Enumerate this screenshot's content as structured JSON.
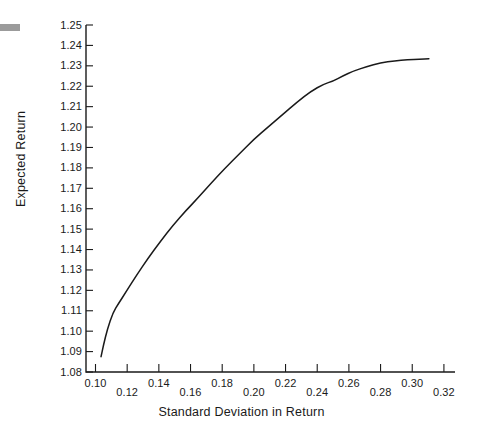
{
  "chart_data": {
    "type": "line",
    "title": "",
    "xlabel": "Standard Deviation in Return",
    "ylabel": "Expected Return",
    "xlim": [
      0.094,
      0.327
    ],
    "ylim": [
      1.08,
      1.25
    ],
    "grid": false,
    "legend": null,
    "xticks": [
      "0.10",
      "0.12",
      "0.14",
      "0.16",
      "0.18",
      "0.20",
      "0.22",
      "0.24",
      "0.26",
      "0.28",
      "0.30",
      "0.32"
    ],
    "xtick_values": [
      0.1,
      0.12,
      0.14,
      0.16,
      0.18,
      0.2,
      0.22,
      0.24,
      0.26,
      0.28,
      0.3,
      0.32
    ],
    "yticks": [
      "1.08",
      "1.09",
      "1.10",
      "1.11",
      "1.12",
      "1.13",
      "1.14",
      "1.15",
      "1.16",
      "1.17",
      "1.18",
      "1.19",
      "1.20",
      "1.21",
      "1.22",
      "1.23",
      "1.24",
      "1.25"
    ],
    "ytick_values": [
      1.08,
      1.09,
      1.1,
      1.11,
      1.12,
      1.13,
      1.14,
      1.15,
      1.16,
      1.17,
      1.18,
      1.19,
      1.2,
      1.21,
      1.22,
      1.23,
      1.24,
      1.25
    ],
    "series": [
      {
        "name": "Efficient Frontier",
        "color": "#1a1a1a",
        "x": [
          0.1035,
          0.105,
          0.1075,
          0.111,
          0.1145,
          0.1195,
          0.126,
          0.133,
          0.141,
          0.149,
          0.157,
          0.165,
          0.173,
          0.182,
          0.191,
          0.2,
          0.209,
          0.218,
          0.227,
          0.236,
          0.244,
          0.25,
          0.256,
          0.263,
          0.271,
          0.28,
          0.289,
          0.297,
          0.305,
          0.3105
        ],
        "y": [
          1.0875,
          1.093,
          1.101,
          1.109,
          1.1135,
          1.1195,
          1.1275,
          1.1355,
          1.144,
          1.152,
          1.159,
          1.1655,
          1.1725,
          1.18,
          1.187,
          1.194,
          1.2,
          1.206,
          1.212,
          1.2175,
          1.221,
          1.2225,
          1.225,
          1.2275,
          1.2295,
          1.2315,
          1.2325,
          1.233,
          1.2333,
          1.2335
        ]
      }
    ]
  },
  "axes": {
    "x_title": "Standard Deviation in Return",
    "y_title": "Expected Return"
  }
}
